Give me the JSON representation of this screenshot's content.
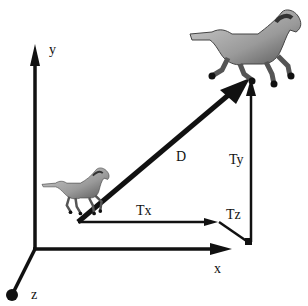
{
  "diagram": {
    "type": "3d-translation-vector",
    "axes": {
      "x_label": "x",
      "y_label": "y",
      "z_label": "z"
    },
    "vectors": {
      "displacement_label": "D",
      "tx_label": "Tx",
      "ty_label": "Ty",
      "tz_label": "Tz"
    },
    "objects": {
      "start": "horse (small, original position)",
      "end": "horse (large, translated position)"
    },
    "colors": {
      "ink": "#111111",
      "background": "#ffffff",
      "horse_light": "#b8b8b8",
      "horse_dark": "#555555"
    }
  }
}
